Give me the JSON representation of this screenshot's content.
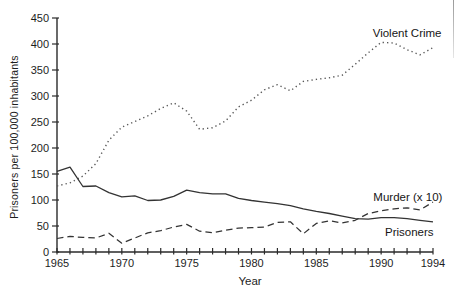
{
  "figure": {
    "background": "#ffffff",
    "axis_color": "#2b2b2b",
    "solid_line_color": "#333333",
    "dashed_line_color": "#333333",
    "dotted_line_color": "#575757",
    "text_color": "#1d1d1d"
  },
  "chart_data": {
    "type": "line",
    "title": "",
    "xlabel": "Year",
    "ylabel": "Prisoners per 100,000 inhabitants",
    "xlim": [
      1965,
      1994
    ],
    "ylim": [
      0,
      450
    ],
    "grid": false,
    "legend_position": "inline-labels",
    "yticks": [
      0,
      50,
      100,
      150,
      200,
      250,
      300,
      350,
      400,
      450
    ],
    "xticks_labeled": [
      1965,
      1970,
      1975,
      1980,
      1985,
      1990,
      1994
    ],
    "xticks_minor_every": 1,
    "x": [
      1965,
      1966,
      1967,
      1968,
      1969,
      1970,
      1971,
      1972,
      1973,
      1974,
      1975,
      1976,
      1977,
      1978,
      1979,
      1980,
      1981,
      1982,
      1983,
      1984,
      1985,
      1986,
      1987,
      1988,
      1989,
      1990,
      1991,
      1992,
      1993,
      1994
    ],
    "series": [
      {
        "name": "Violent Crime",
        "style": "dotted",
        "values": [
          127,
          133,
          146,
          170,
          215,
          240,
          251,
          262,
          276,
          287,
          271,
          236,
          239,
          252,
          279,
          292,
          312,
          322,
          310,
          328,
          332,
          335,
          340,
          361,
          383,
          403,
          402,
          389,
          379,
          393
        ]
      },
      {
        "name": "Murder (x 10)",
        "style": "dashed",
        "values": [
          26,
          30,
          28,
          27,
          36,
          17,
          27,
          37,
          41,
          48,
          53,
          40,
          37,
          42,
          46,
          47,
          48,
          57,
          58,
          35,
          55,
          60,
          56,
          61,
          74,
          79,
          83,
          85,
          81,
          96
        ]
      },
      {
        "name": "Prisoners",
        "style": "solid",
        "values": [
          155,
          163,
          126,
          127,
          114,
          106,
          108,
          99,
          100,
          107,
          119,
          114,
          112,
          112,
          103,
          99,
          96,
          93,
          89,
          83,
          78,
          74,
          69,
          64,
          63,
          66,
          66,
          64,
          61,
          58
        ]
      }
    ],
    "annotations": [
      {
        "label": "Violent Crime",
        "x": 1989.35,
        "y": 421
      },
      {
        "label": "Murder (x 10)",
        "x": 1989.4,
        "y": 106
      },
      {
        "label": "Prisoners",
        "x": 1990.3,
        "y": 38
      }
    ]
  }
}
